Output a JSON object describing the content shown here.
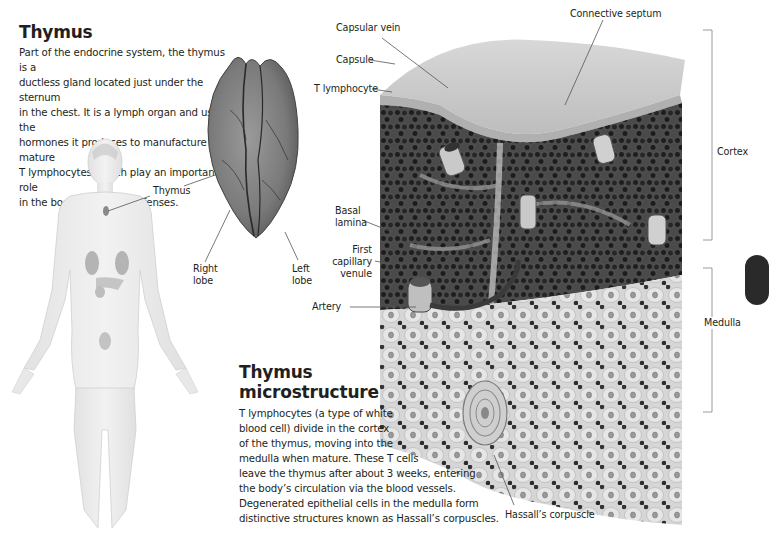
{
  "intro": {
    "title": "Thymus",
    "body": "Part of the endocrine system, the thymus is a ductless gland located just under the sternum in the chest. It is a lymph organ and uses the hormones it produces to manufacture mature T lymphocytes, which play an important role in the body’s immune defenses.",
    "lines": [
      "Part of the endocrine system, the thymus is a",
      "ductless gland located just under the sternum",
      "in the chest. It is a lymph organ and uses the",
      "hormones it produces to manufacture mature",
      "T lymphocytes, which play an important role",
      "in the body’s immune defenses."
    ]
  },
  "body_figure": {
    "labels": {
      "thymus": "Thymus"
    }
  },
  "organ": {
    "labels": {
      "right_lobe": [
        "Right",
        "lobe"
      ],
      "left_lobe": [
        "Left",
        "lobe"
      ]
    },
    "color": "#7a7a7a"
  },
  "microstructure": {
    "title_lines": [
      "Thymus",
      "microstructure"
    ],
    "lines": [
      "T lymphocytes (a type of white",
      "blood cell) divide in the cortex",
      "of the thymus, moving into the",
      "medulla when mature. These T cells",
      "leave the thymus after about 3 weeks, entering",
      "the body’s circulation via the blood vessels.",
      "Degenerated epithelial cells in the medulla form",
      "distinctive structures known as Hassall’s corpuscles."
    ],
    "labels": {
      "capsular_vein": "Capsular vein",
      "connective_septum": "Connective septum",
      "capsule": "Capsule",
      "t_lymphocyte": "T lymphocyte",
      "basal_lamina": [
        "Basal",
        "lamina"
      ],
      "first_capillary_venule": [
        "First",
        "capillary",
        "venule"
      ],
      "artery": "Artery",
      "cortex": "Cortex",
      "medulla": "Medulla",
      "hassalls_corpuscle": "Hassall’s corpuscle"
    },
    "colors": {
      "cortex_cells": "#2e2e2e",
      "medulla_bg": "#d9d9d9",
      "capsule": "#c8c8c8"
    }
  }
}
